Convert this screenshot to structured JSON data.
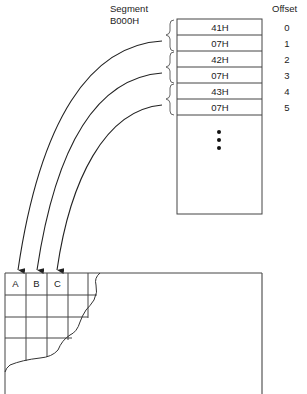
{
  "diagram": {
    "segment_label": "Segment",
    "segment_address": "B000H",
    "offset_header": "Offset",
    "memory_cells": [
      {
        "value": "41H",
        "offset": "0"
      },
      {
        "value": "07H",
        "offset": "1"
      },
      {
        "value": "42H",
        "offset": "2"
      },
      {
        "value": "07H",
        "offset": "3"
      },
      {
        "value": "43H",
        "offset": "4"
      },
      {
        "value": "07H",
        "offset": "5"
      }
    ],
    "continuation": "ellipsis-dots",
    "screen_cells": [
      "A",
      "B",
      "C"
    ],
    "colors": {
      "stroke": "#333333",
      "text": "#222222",
      "background": "#ffffff"
    }
  }
}
